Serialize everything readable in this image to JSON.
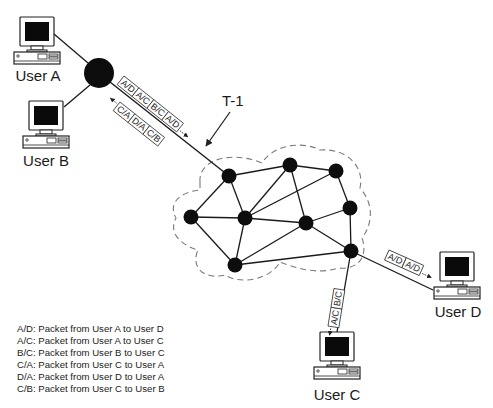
{
  "users": [
    {
      "id": "A",
      "label": "User A"
    },
    {
      "id": "B",
      "label": "User B"
    },
    {
      "id": "C",
      "label": "User C"
    },
    {
      "id": "D",
      "label": "User D"
    }
  ],
  "link_label": "T-1",
  "packets": {
    "trunk_outbound": [
      "A/D",
      "A/C",
      "B/C",
      "A/D"
    ],
    "trunk_inbound": [
      "C/A",
      "D/A",
      "C/B"
    ],
    "to_user_d": [
      "A/D",
      "A/D"
    ],
    "to_user_c": [
      "A/C",
      "B/C"
    ]
  },
  "legend": [
    "A/D: Packet from User A to User D",
    "A/C: Packet from User A to User C",
    "B/C: Packet from User B to User C",
    "C/A: Packet from User C to User A",
    "D/A: Packet from User D to User A",
    "C/B: Packet from User C to User B"
  ],
  "colors": {
    "line": "#1a1a1a",
    "node": "#0d0d0d",
    "cloud_dash": "#7a7a7a",
    "screen": "#0a0a0a"
  }
}
